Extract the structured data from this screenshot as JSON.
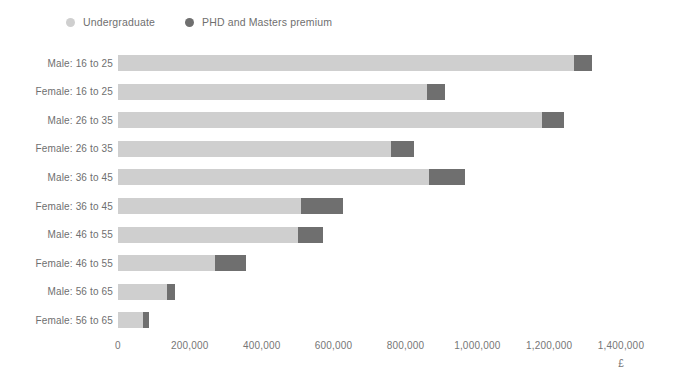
{
  "legend": {
    "items": [
      {
        "label": "Undergraduate",
        "color": "#cfcfcf",
        "icon": "legend-dot-icon"
      },
      {
        "label": "PHD and Masters premium",
        "color": "#6f6f6f",
        "icon": "legend-dot-icon"
      }
    ]
  },
  "axis": {
    "unit_label": "£",
    "x_ticks": [
      "0",
      "200,000",
      "400,000",
      "600,000",
      "800,000",
      "1,000,000",
      "1,200,000",
      "1,400,000"
    ]
  },
  "chart_data": {
    "type": "bar",
    "orientation": "horizontal",
    "stacked": true,
    "title": "",
    "subtitle": "",
    "xlabel": "£",
    "ylabel": "",
    "xlim": [
      0,
      1400000
    ],
    "xticks": [
      0,
      200000,
      400000,
      600000,
      800000,
      1000000,
      1200000,
      1400000
    ],
    "xticklabels": [
      "0",
      "200,000",
      "400,000",
      "600,000",
      "800,000",
      "1,000,000",
      "1,200,000",
      "1,400,000"
    ],
    "grid": false,
    "legend_position": "top-left",
    "categories": [
      "Male: 16 to 25",
      "Female: 16 to 25",
      "Male: 26 to 35",
      "Female: 26 to 35",
      "Male: 36 to 45",
      "Female: 36 to 45",
      "Male: 46 to 55",
      "Female: 46 to 55",
      "Male: 56 to 65",
      "Female: 56 to 65"
    ],
    "series": [
      {
        "name": "Undergraduate",
        "color": "#cfcfcf",
        "values": [
          1270000,
          860000,
          1180000,
          760000,
          865000,
          510000,
          500000,
          270000,
          135000,
          70000
        ]
      },
      {
        "name": "PHD and Masters premium",
        "color": "#6f6f6f",
        "values": [
          50000,
          50000,
          60000,
          65000,
          100000,
          115000,
          70000,
          85000,
          25000,
          15000
        ]
      }
    ],
    "totals": [
      1320000,
      910000,
      1240000,
      825000,
      965000,
      625000,
      570000,
      355000,
      160000,
      85000
    ]
  }
}
